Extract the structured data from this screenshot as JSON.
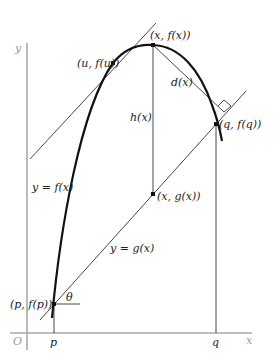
{
  "diagram": {
    "colors": {
      "axis": "#aaaaaa",
      "curve": "#111111",
      "line": "#333333",
      "text": "#222222",
      "axis_text": "#9a9a9a"
    },
    "axes": {
      "x_label": "x",
      "y_label": "y",
      "origin_label": "O"
    },
    "ticks": {
      "p": "p",
      "q": "q"
    },
    "curve_label": "y = f(x)",
    "line_label": "y = g(x)",
    "points": {
      "u": "(u, f(u))",
      "x_top": "(x, f(x))",
      "q": "(q, f(q))",
      "x_bottom": "(x, g(x))",
      "p": "(p, f(p))"
    },
    "segment_labels": {
      "h": "h(x)",
      "d": "d(x)",
      "theta": "θ"
    }
  }
}
